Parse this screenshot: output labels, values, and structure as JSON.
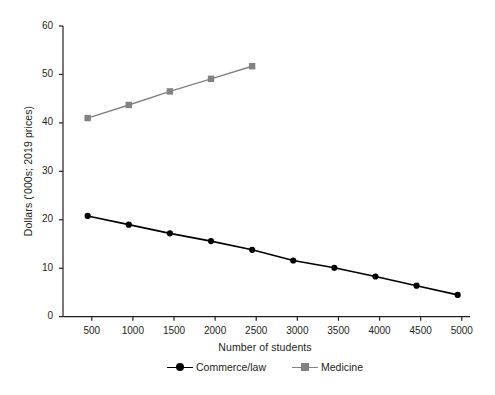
{
  "chart_data": {
    "type": "line",
    "title": "",
    "xlabel": "Number of students",
    "ylabel": "Dollars ('000s; 2019 prices)",
    "xlim": [
      150,
      5100
    ],
    "ylim": [
      0,
      60
    ],
    "xticks": [
      500,
      1000,
      1500,
      2000,
      2500,
      3000,
      3500,
      4000,
      4500,
      5000
    ],
    "xtick_labels": [
      "500",
      "1000",
      "1500",
      "2000",
      "2500",
      "3000",
      "3500",
      "4000",
      "4500",
      "5000"
    ],
    "yticks": [
      0,
      10,
      20,
      30,
      40,
      50,
      60
    ],
    "ytick_labels": [
      "0",
      "10",
      "20",
      "30",
      "40",
      "50",
      "60"
    ],
    "grid": false,
    "legend_position": "bottom-center",
    "series": [
      {
        "name": "Commerce/law",
        "color": "#000000",
        "marker": "circle",
        "x": [
          450,
          950,
          1450,
          1950,
          2450,
          2950,
          3450,
          3950,
          4450,
          4950
        ],
        "values": [
          20.8,
          19.0,
          17.2,
          15.6,
          13.8,
          11.6,
          10.1,
          8.3,
          6.4,
          4.5
        ]
      },
      {
        "name": "Medicine",
        "color": "#808285",
        "marker": "square",
        "x": [
          450,
          950,
          1450,
          1950,
          2450
        ],
        "values": [
          41.0,
          43.7,
          46.5,
          49.1,
          51.7
        ]
      }
    ]
  },
  "legend": {
    "items": [
      {
        "label": "Commerce/law"
      },
      {
        "label": "Medicine"
      }
    ]
  }
}
